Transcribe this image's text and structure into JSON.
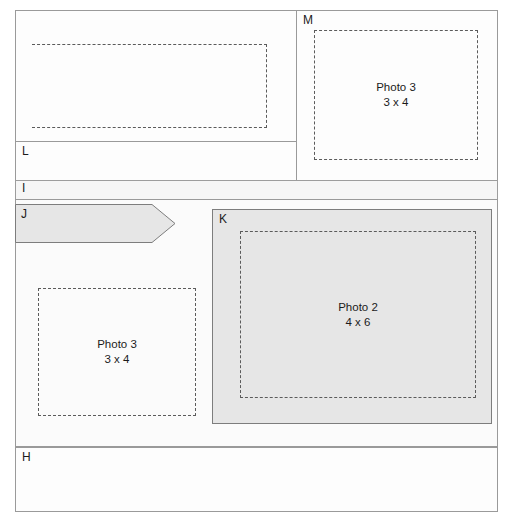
{
  "diagram": {
    "colors": {
      "frame_stroke": "#8f8f8f",
      "region_stroke": "#9a9a9a",
      "shaded_fill": "#e6e6e6",
      "band_fill": "#f6f6f6",
      "dashed_stroke": "#5b5b5b",
      "label_text": "#1b1b1b"
    },
    "regions": [
      {
        "id": "panel-top-left",
        "label": "",
        "fill": "white",
        "x": 15,
        "y": 10,
        "w": 282,
        "h": 132
      },
      {
        "id": "panel-l",
        "label": "L",
        "fill": "white",
        "x": 15,
        "y": 141,
        "w": 282,
        "h": 40
      },
      {
        "id": "panel-m",
        "label": "M",
        "fill": "white",
        "x": 296,
        "y": 10,
        "w": 202,
        "h": 171
      },
      {
        "id": "panel-i",
        "label": "I",
        "fill": "#f6f6f6",
        "x": 15,
        "y": 180,
        "w": 483,
        "h": 20
      },
      {
        "id": "arrow-j",
        "label": "J",
        "fill": "#e6e6e6",
        "x": 15,
        "y": 204,
        "w": 161,
        "h": 39
      },
      {
        "id": "panel-k",
        "label": "K",
        "fill": "#e6e6e6",
        "x": 212,
        "y": 209,
        "w": 280,
        "h": 215
      },
      {
        "id": "panel-h",
        "label": "H",
        "fill": "white",
        "x": 15,
        "y": 447,
        "w": 483,
        "h": 65
      }
    ],
    "labels": {
      "l": "L",
      "m": "M",
      "i": "I",
      "j": "J",
      "k": "K",
      "h": "H"
    },
    "placeholders": [
      {
        "id": "dash-top-left",
        "name": "",
        "size": "",
        "parent": "panel-top-left"
      },
      {
        "id": "dash-m",
        "name": "Photo 3",
        "size": "3 x 4",
        "parent": "panel-m"
      },
      {
        "id": "dash-lower-left",
        "name": "Photo 3",
        "size": "3 x 4",
        "parent": "panel-middle"
      },
      {
        "id": "dash-k",
        "name": "Photo 2",
        "size": "4 x 6",
        "parent": "panel-k"
      }
    ],
    "photo_m": {
      "name": "Photo 3",
      "size": "3 x 4"
    },
    "photo_lower_left": {
      "name": "Photo 3",
      "size": "3 x 4"
    },
    "photo_k": {
      "name": "Photo 2",
      "size": "4 x 6"
    }
  }
}
